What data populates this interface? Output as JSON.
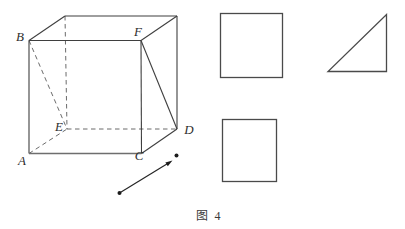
{
  "figure": {
    "caption": "图 4",
    "colors": {
      "background": "#ffffff",
      "line": "#3f3f3f",
      "dashed_line": "#5a5a5a",
      "vector": "#1c1c1c"
    },
    "cube": {
      "labels": {
        "A": "A",
        "B": "B",
        "C": "C",
        "D": "D",
        "E": "E",
        "F": "F"
      }
    },
    "side_shapes": [
      {
        "name": "top-square",
        "kind": "square"
      },
      {
        "name": "right-triangle",
        "kind": "right triangle"
      },
      {
        "name": "bottom-square",
        "kind": "square"
      }
    ],
    "vector": {
      "kind": "arrow segment with endpoint dots",
      "direction": "up-right"
    }
  }
}
